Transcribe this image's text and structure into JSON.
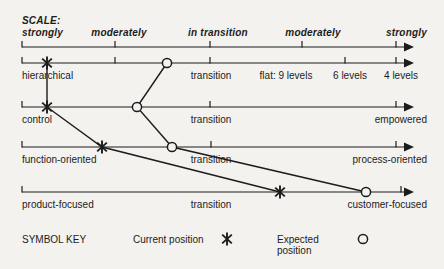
{
  "colors": {
    "ink": "#1c1c1c",
    "background": "#f3f2ef"
  },
  "scale": {
    "title": "SCALE:",
    "labels": [
      "strongly",
      "moderately",
      "in transition",
      "moderately",
      "strongly"
    ]
  },
  "rows": [
    {
      "left": "hierarchical",
      "mid": "transition",
      "extras": [
        "flat: 9 levels",
        "6 levels",
        "4 levels"
      ]
    },
    {
      "left": "control",
      "mid": "transition",
      "right": "empowered"
    },
    {
      "left": "function-oriented",
      "mid": "transition",
      "right": "process-oriented"
    },
    {
      "left": "product-focused",
      "mid": "transition",
      "right": "customer-focused"
    }
  ],
  "key": {
    "title": "SYMBOL KEY",
    "current": "Current position",
    "expected": "Expected position"
  },
  "chart_data": {
    "type": "scatter",
    "title": "SCALE:",
    "scale_ticks": [
      "strongly",
      "moderately",
      "in transition",
      "moderately",
      "strongly"
    ],
    "axes": [
      "hierarchical - flat: 9 levels / 6 levels / 4 levels",
      "control - empowered",
      "function-oriented - process-oriented",
      "product-focused - customer-focused"
    ],
    "series": [
      {
        "name": "Current position",
        "symbol": "star",
        "values_0to1": [
          0.07,
          0.07,
          0.21,
          0.69
        ]
      },
      {
        "name": "Expected position",
        "symbol": "circle",
        "values_0to1": [
          0.39,
          0.31,
          0.4,
          0.92
        ]
      }
    ],
    "legend_position": "bottom"
  },
  "geometry": {
    "canvas": {
      "w": 444,
      "h": 269
    },
    "axis": {
      "x_start": 22,
      "x_end": 404,
      "arrow_tip": 414
    },
    "ruler": {
      "y": 47,
      "ticks": [
        22,
        115,
        210,
        302,
        396
      ]
    },
    "axes": [
      {
        "y": 63,
        "ticks": [
          22,
          115,
          210,
          345,
          396
        ],
        "star_x": 47,
        "circle_x": 167
      },
      {
        "y": 107,
        "ticks": [
          22,
          210,
          396
        ],
        "star_x": 47,
        "circle_x": 137
      },
      {
        "y": 147,
        "ticks": [
          22,
          211,
          396
        ],
        "star_x": 102,
        "circle_x": 172
      },
      {
        "y": 192,
        "ticks": [
          22,
          401
        ],
        "star_x": 280,
        "circle_x": 366
      }
    ]
  }
}
